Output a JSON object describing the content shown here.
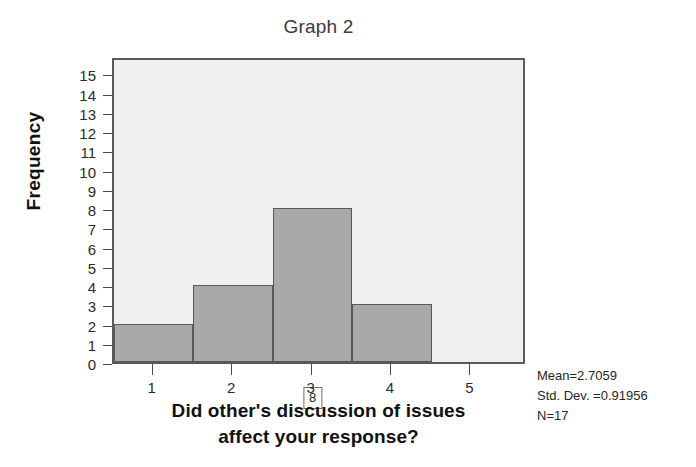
{
  "chart_data": {
    "type": "bar",
    "title": "Graph 2",
    "xlabel": "Did other's discussion of issues affect your response?",
    "ylabel": "Frequency",
    "categories": [
      "1",
      "2",
      "3",
      "4",
      "5"
    ],
    "values": [
      2,
      4,
      8,
      3,
      0
    ],
    "bar_labels": [
      "2",
      "4",
      "8",
      "3",
      ""
    ],
    "x": [
      1,
      2,
      3,
      4,
      5
    ],
    "xlim": [
      0.5,
      5.7
    ],
    "ylim": [
      0,
      15.9
    ],
    "ytick_labels": [
      "15",
      "14",
      "13",
      "12",
      "11",
      "10",
      "9",
      "8",
      "7",
      "6",
      "5",
      "4",
      "3",
      "2",
      "1",
      "0"
    ],
    "ytick_values": [
      15,
      14,
      13,
      12,
      11,
      10,
      9,
      8,
      7,
      6,
      5,
      4,
      3,
      2,
      1,
      0
    ],
    "xtick_labels": [
      "1",
      "2",
      "3",
      "4",
      "5"
    ],
    "grid": false,
    "legend": false,
    "bar_fill_color": "#a9a9a9",
    "bar_edge_color": "#585858",
    "plot_background_color": "#f0f0f0",
    "axis_color": "#5a5a5a"
  },
  "title": {
    "text": "Graph 2"
  },
  "axes": {
    "y_title": "Frequency",
    "x_title_line1": "Did other's discussion of issues",
    "x_title_line2": "affect your response?"
  },
  "stats": {
    "mean": "Mean=2.7059",
    "std_dev": "Std. Dev. =0.91956",
    "n": "N=17"
  }
}
